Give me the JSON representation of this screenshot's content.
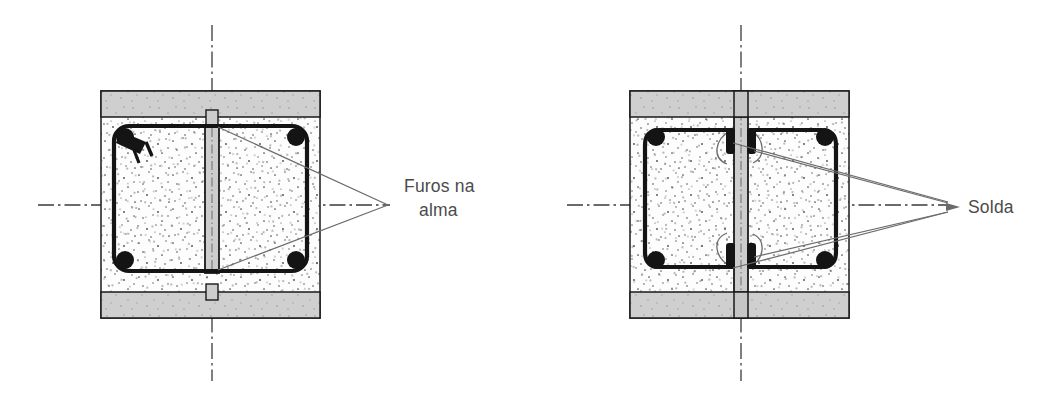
{
  "figure": {
    "title_visible": false,
    "background_color": "#ffffff",
    "line_color": "#1a1a1a",
    "leader_color": "#6b6b6b",
    "concrete_fill": "#fdfdfd",
    "steel_flange_fill": "#cfcfcf",
    "web_plate_fill": "#cdcdcd",
    "text_color": "#4b4b4b",
    "centerline_color": "#3b3b3b"
  },
  "callouts": [
    {
      "id": "furos-na-alma",
      "line1": "Furos na",
      "line2": "alma",
      "full_text": "Furos na alma",
      "anchor_x": 393,
      "anchor_y": 205,
      "text_x": 404,
      "text_y1": 192,
      "text_y2": 216,
      "leaders": [
        {
          "x1": 388,
          "y1": 205,
          "x2": 216,
          "y2": 126
        },
        {
          "x1": 388,
          "y1": 205,
          "x2": 216,
          "y2": 270
        }
      ]
    },
    {
      "id": "solda",
      "line1": "Solda",
      "line2": "",
      "full_text": "Solda",
      "anchor_x": 952,
      "anchor_y": 207,
      "text_x": 966,
      "text_y1": 213,
      "text_y2": 213,
      "leaders": [
        {
          "x1": 948,
          "y1": 201,
          "x2": 731,
          "y2": 144
        },
        {
          "x1": 948,
          "y1": 201,
          "x2": 753,
          "y2": 152
        },
        {
          "x1": 948,
          "y1": 213,
          "x2": 731,
          "y2": 268
        },
        {
          "x1": 948,
          "y1": 213,
          "x2": 753,
          "y2": 258
        }
      ]
    }
  ],
  "sections": [
    {
      "id": "section-left",
      "name": "web-with-holes-section",
      "outer": {
        "x": 101,
        "y": 91,
        "width": 219,
        "height": 227
      },
      "flange_top": {
        "x": 101,
        "y": 91,
        "width": 219,
        "height": 26
      },
      "flange_bottom": {
        "x": 101,
        "y": 292,
        "width": 219,
        "height": 26
      },
      "web_plate": {
        "x": 206,
        "y": 117,
        "width": 11,
        "height": 175
      },
      "notch_top": {
        "x": 206,
        "y": 110,
        "width": 11,
        "height": 14
      },
      "notch_bottom": {
        "x": 206,
        "y": 285,
        "width": 11,
        "height": 14
      },
      "stirrup": {
        "x": 114,
        "y": 126,
        "width": 193,
        "height": 145,
        "radius": 15
      },
      "bars": [
        {
          "cx": 125,
          "cy": 137,
          "r": 9
        },
        {
          "cx": 296,
          "cy": 137,
          "r": 9
        },
        {
          "cx": 125,
          "cy": 260,
          "r": 9
        },
        {
          "cx": 296,
          "cy": 260,
          "r": 9
        }
      ],
      "hook": {
        "x": 122,
        "y": 131,
        "size": 22
      },
      "vertical_centerline": {
        "x": 212,
        "y1": 25,
        "y2": 381
      },
      "horizontal_centerline": {
        "y": 205,
        "x1": 38,
        "x2": 390
      }
    },
    {
      "id": "section-right",
      "name": "welded-twin-stirrup-section",
      "outer": {
        "x": 630,
        "y": 91,
        "width": 219,
        "height": 227
      },
      "flange_top": {
        "x": 630,
        "y": 91,
        "width": 219,
        "height": 26
      },
      "flange_bottom": {
        "x": 630,
        "y": 292,
        "width": 219,
        "height": 26
      },
      "web_plate": {
        "x": 735,
        "y": 91,
        "width": 11,
        "height": 227
      },
      "stirrup_left": {
        "x": 645,
        "y": 126,
        "width": 85,
        "height": 145,
        "radius": 15
      },
      "stirrup_right": {
        "x": 751,
        "y": 126,
        "width": 85,
        "height": 145,
        "radius": 15
      },
      "bars": [
        {
          "cx": 656,
          "cy": 137,
          "r": 9
        },
        {
          "cx": 825,
          "cy": 137,
          "r": 9
        },
        {
          "cx": 656,
          "cy": 260,
          "r": 9
        },
        {
          "cx": 825,
          "cy": 260,
          "r": 9
        }
      ],
      "weld_marks": [
        {
          "side": "left",
          "cx": 731,
          "cy": 148
        },
        {
          "side": "left",
          "cx": 731,
          "cy": 262
        },
        {
          "side": "right",
          "cx": 750,
          "cy": 148
        },
        {
          "side": "right",
          "cx": 750,
          "cy": 262
        }
      ],
      "vertical_centerline": {
        "x": 741,
        "y1": 25,
        "y2": 381
      },
      "horizontal_centerline": {
        "y": 205,
        "x1": 567,
        "x2": 950
      }
    }
  ],
  "icons": {
    "arrowhead": "leader-arrowhead",
    "centerline": "dash-dot-centerline",
    "stipple": "concrete-stipple-texture"
  }
}
